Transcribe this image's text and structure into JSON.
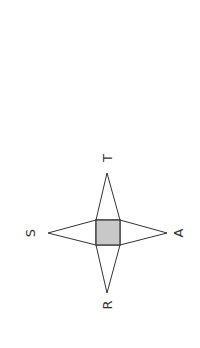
{
  "diagram": {
    "labels": {
      "top": "T",
      "left": "S",
      "right": "A",
      "bottom": "R"
    },
    "colors": {
      "stroke": "#333333",
      "base_fill": "#c8c8c8",
      "background": "#ffffff"
    }
  }
}
